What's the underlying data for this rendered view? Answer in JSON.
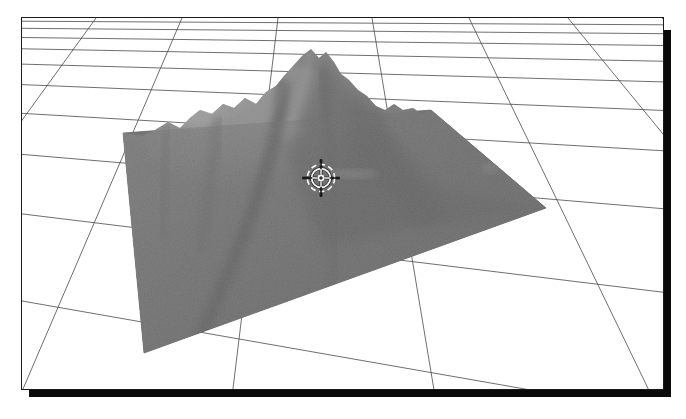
{
  "app": {
    "title": "3D Terrain Viewer",
    "view_label": "Perspective"
  },
  "viewport": {
    "name": "terrain-3d-viewport",
    "background_color": "#ffffff",
    "frame_color": "#1a1a1a",
    "shadow_color": "#0a0a0a",
    "width": 643,
    "height": 373
  },
  "scene": {
    "type": "3d-terrain-surface",
    "description": "Grayscale shaded relief of a mountain peak rendered on a square terrain plate above a white perspective ground grid.",
    "grid": {
      "name": "ground-grid",
      "line_color": "#4a4a4a",
      "line_width": 0.8,
      "horizon_y": 2,
      "rows": 12,
      "columns": 9,
      "visible": true
    },
    "terrain_plate": {
      "name": "terrain-base-plate",
      "fill_color": "#7a7a7a",
      "corner_top": [
        409,
        92
      ],
      "corner_right": [
        524,
        190
      ],
      "corner_bottom": [
        122,
        335
      ],
      "corner_left": [
        101,
        115
      ]
    },
    "mountain": {
      "name": "mountain-peak",
      "summit_screen": [
        289,
        31
      ],
      "shade_light": "#b4b4b4",
      "shade_mid": "#7f7f7f",
      "shade_dark": "#4e4e4e"
    }
  },
  "cursor": {
    "name": "crosshair-reticle",
    "x": 299,
    "y": 160,
    "color": "#f2f2f2",
    "shadow_color": "#1c1c1c",
    "radius_outer": 15,
    "radius_inner": 9,
    "arm_length": 19
  },
  "chart_data": {
    "type": "heatmap",
    "xlabel": "East",
    "ylabel": "North",
    "zlabel": "Elevation",
    "grid": true,
    "legend": "none",
    "colormap": "grayscale",
    "nx": 46,
    "ny": 46,
    "note": "Single conical peak with a secondary shoulder to the west; values are normalized elevation 0–1 sampled on a regular 46×46 lattice.",
    "peak": {
      "u": 0.52,
      "v": 0.3,
      "height": 1.0
    },
    "secondary_peak": {
      "u": 0.34,
      "v": 0.4,
      "height": 0.62
    },
    "ridge_axis_deg": 22,
    "base_level": 0.05,
    "elevation_range": [
      0,
      1
    ]
  }
}
